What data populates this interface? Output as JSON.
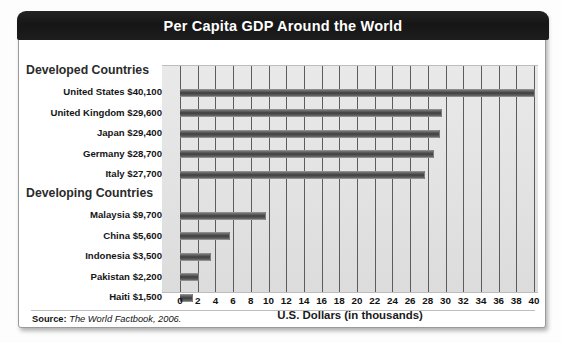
{
  "card": {
    "title": "Per Capita GDP Around the World",
    "source_prefix": "Source:",
    "source_text": "The World Factbook, 2006."
  },
  "chart_data": {
    "type": "bar",
    "orientation": "horizontal",
    "title": "Per Capita GDP Around the World",
    "xlabel": "U.S. Dollars (in thousands)",
    "ylabel": "",
    "xlim": [
      0,
      40
    ],
    "xticks": [
      0,
      2,
      4,
      6,
      8,
      10,
      12,
      14,
      16,
      18,
      20,
      22,
      24,
      26,
      28,
      30,
      32,
      34,
      36,
      38,
      40
    ],
    "grid": true,
    "legend": "none",
    "units": "thousands of U.S. dollars",
    "groups": [
      {
        "name": "Developed Countries",
        "categories": [
          "United States",
          "United Kingdom",
          "Japan",
          "Germany",
          "Italy"
        ],
        "values": [
          40.1,
          29.6,
          29.4,
          28.7,
          27.7
        ],
        "value_labels": [
          "$40,100",
          "$29,600",
          "$29,400",
          "$28,700",
          "$27,700"
        ]
      },
      {
        "name": "Developing Countries",
        "categories": [
          "Malaysia",
          "China",
          "Indonesia",
          "Pakistan",
          "Haiti"
        ],
        "values": [
          9.7,
          5.6,
          3.5,
          2.2,
          1.5
        ],
        "value_labels": [
          "$9,700",
          "$5,600",
          "$3,500",
          "$2,200",
          "$1,500"
        ]
      }
    ],
    "rows": [
      {
        "kind": "group",
        "label": "Developed Countries"
      },
      {
        "kind": "bar",
        "label": "United States $40,100",
        "category": "United States",
        "value": 40.1
      },
      {
        "kind": "bar",
        "label": "United Kingdom $29,600",
        "category": "United Kingdom",
        "value": 29.6
      },
      {
        "kind": "bar",
        "label": "Japan $29,400",
        "category": "Japan",
        "value": 29.4
      },
      {
        "kind": "bar",
        "label": "Germany $28,700",
        "category": "Germany",
        "value": 28.7
      },
      {
        "kind": "bar",
        "label": "Italy $27,700",
        "category": "Italy",
        "value": 27.7
      },
      {
        "kind": "group",
        "label": "Developing Countries"
      },
      {
        "kind": "bar",
        "label": "Malaysia $9,700",
        "category": "Malaysia",
        "value": 9.7
      },
      {
        "kind": "bar",
        "label": "China $5,600",
        "category": "China",
        "value": 5.6
      },
      {
        "kind": "bar",
        "label": "Indonesia $3,500",
        "category": "Indonesia",
        "value": 3.5
      },
      {
        "kind": "bar",
        "label": "Pakistan $2,200",
        "category": "Pakistan",
        "value": 2.2
      },
      {
        "kind": "bar",
        "label": "Haiti $1,500",
        "category": "Haiti",
        "value": 1.5
      }
    ],
    "colors": {
      "bar": "#3e3e3e",
      "plot_background": "#e4e4e4",
      "gridline": "#5c5c5c",
      "title_bar": "#1b1b1b",
      "title_text": "#ffffff"
    }
  }
}
